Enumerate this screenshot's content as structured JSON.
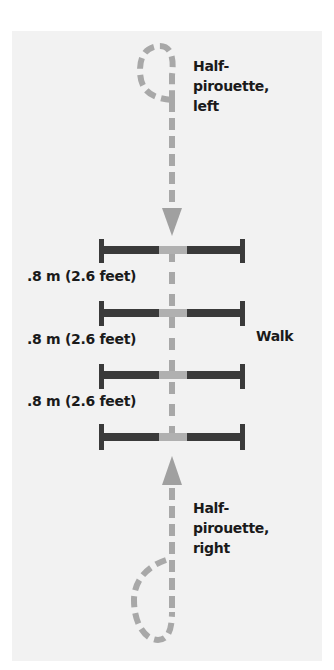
{
  "diagram": {
    "labels": {
      "top_turn": "Half-pirouette, left",
      "top_turn_lines": [
        "Half-",
        "pirouette,",
        "left"
      ],
      "bottom_turn": "Half-pirouette, right",
      "bottom_turn_lines": [
        "Half-",
        "pirouette,",
        "right"
      ],
      "walk": "Walk"
    },
    "distances": [
      ".8 m (2.6 feet)",
      ".8 m (2.6 feet)",
      ".8 m (2.6 feet)"
    ],
    "poles_count": 4,
    "colors": {
      "panel_bg": "#f2f2f2",
      "path": "#a8a8a8",
      "pole": "#3a3a3a",
      "pole_center": "#b0b0b0",
      "text": "#1a1a1a"
    }
  }
}
